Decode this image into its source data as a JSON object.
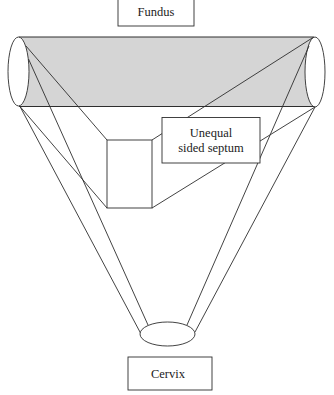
{
  "diagram": {
    "labels": {
      "fundus": "Fundus",
      "septum_line1": "Unequal",
      "septum_line2": "sided septum",
      "cervix": "Cervix"
    },
    "colors": {
      "fundal_band": "#d5d5d5",
      "line": "#2e2e2e",
      "background": "#ffffff"
    }
  }
}
